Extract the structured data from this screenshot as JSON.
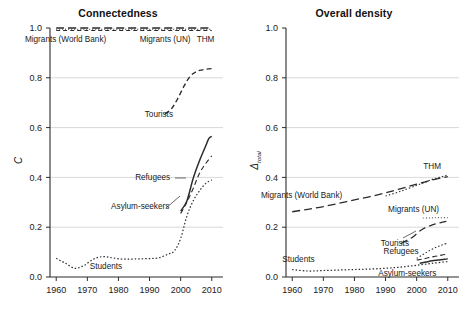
{
  "figure": {
    "width": 472,
    "height": 312,
    "background": "#ffffff",
    "ink": "#2b2b2b",
    "grid_color": "#c9c9c9"
  },
  "chart_data": [
    {
      "type": "line",
      "panel": "left",
      "title": "Connectedness",
      "xlabel": "",
      "ylabel": "C",
      "xlim": [
        1958,
        2012
      ],
      "ylim": [
        0.0,
        1.0
      ],
      "grid": true,
      "grid_axis": "y",
      "legend_position": "inline-annotations",
      "xticks": [
        1960,
        1970,
        1980,
        1990,
        2000,
        2010
      ],
      "xtick_labels": [
        "1960",
        "1970",
        "1980",
        "1990",
        "2000",
        "2010"
      ],
      "yticks": [
        0.0,
        0.2,
        0.4,
        0.6,
        0.8,
        1.0
      ],
      "ytick_labels": [
        "0.0",
        "0.2",
        "0.4",
        "0.6",
        "0.8",
        "1.0"
      ],
      "series": [
        {
          "name": "Migrants (World Bank)",
          "dash": "8,4",
          "width": 1.3,
          "x": [
            1960,
            1970,
            1980,
            1990,
            2000,
            2010
          ],
          "values": [
            1.0,
            1.0,
            1.0,
            1.0,
            1.0,
            1.0
          ]
        },
        {
          "name": "Migrants (UN)",
          "dash": "1,2",
          "width": 1.1,
          "x": [
            1960,
            1970,
            1980,
            1990,
            2000,
            2010
          ],
          "values": [
            0.995,
            0.995,
            0.995,
            0.995,
            0.995,
            0.995
          ]
        },
        {
          "name": "THM",
          "dash": "4,3",
          "width": 1.2,
          "x": [
            1960,
            1970,
            1980,
            1990,
            2000,
            2010
          ],
          "values": [
            0.99,
            0.99,
            0.99,
            0.99,
            0.99,
            0.99
          ]
        },
        {
          "name": "Tourists",
          "dash": "5,3",
          "width": 1.4,
          "x": [
            1995,
            1997,
            1999,
            2001,
            2003,
            2005,
            2007,
            2009,
            2010
          ],
          "values": [
            0.655,
            0.675,
            0.715,
            0.765,
            0.805,
            0.825,
            0.832,
            0.836,
            0.837
          ]
        },
        {
          "name": "Refugees",
          "dash": "5,3",
          "width": 1.1,
          "x": [
            2000,
            2002,
            2004,
            2006,
            2008,
            2010
          ],
          "values": [
            0.255,
            0.3,
            0.355,
            0.415,
            0.455,
            0.487
          ]
        },
        {
          "name": "Asylum-seekers",
          "dash": "none",
          "width": 1.5,
          "x": [
            2000,
            2002,
            2004,
            2006,
            2008,
            2009,
            2010
          ],
          "values": [
            0.265,
            0.305,
            0.395,
            0.465,
            0.525,
            0.555,
            0.565
          ]
        },
        {
          "name": "Students",
          "dash": "1.5,2",
          "width": 1.2,
          "x": [
            1960,
            1963,
            1966,
            1969,
            1972,
            1975,
            1978,
            1981,
            1984,
            1987,
            1990,
            1993,
            1996,
            1998,
            2000,
            2002,
            2004,
            2006,
            2008,
            2010
          ],
          "values": [
            0.075,
            0.055,
            0.035,
            0.047,
            0.072,
            0.082,
            0.077,
            0.072,
            0.072,
            0.073,
            0.074,
            0.077,
            0.092,
            0.105,
            0.155,
            0.245,
            0.305,
            0.345,
            0.375,
            0.39
          ]
        }
      ],
      "annotations": [
        {
          "text": "Migrants (World Bank)",
          "x": 1963,
          "y": 0.955
        },
        {
          "text": "Migrants (UN)",
          "x": 1995,
          "y": 0.955
        },
        {
          "text": "THM",
          "x": 2008,
          "y": 0.955
        },
        {
          "text": "Tourists",
          "x": 1993,
          "y": 0.655
        },
        {
          "text": "Refugees",
          "x": 1991,
          "y": 0.4
        },
        {
          "text": "Asylum-seekers",
          "x": 1987,
          "y": 0.285
        },
        {
          "text": "Students",
          "x": 1976,
          "y": 0.045
        }
      ]
    },
    {
      "type": "line",
      "panel": "right",
      "title": "Overall density",
      "xlabel": "",
      "ylabel": "Δ",
      "ylabel_sub": "total",
      "xlim": [
        1958,
        2012
      ],
      "ylim": [
        0.0,
        1.0
      ],
      "grid": true,
      "grid_axis": "y",
      "legend_position": "inline-annotations",
      "xticks": [
        1960,
        1970,
        1980,
        1990,
        2000,
        2010
      ],
      "xtick_labels": [
        "1960",
        "1970",
        "1980",
        "1990",
        "2000",
        "2010"
      ],
      "yticks": [
        0.0,
        0.2,
        0.4,
        0.6,
        0.8,
        1.0
      ],
      "ytick_labels": [
        "0.0",
        "0.2",
        "0.4",
        "0.6",
        "0.8",
        "1.0"
      ],
      "series": [
        {
          "name": "Migrants (World Bank)",
          "dash": "8,4",
          "width": 1.3,
          "x": [
            1960,
            1965,
            1970,
            1975,
            1980,
            1985,
            1990,
            1995,
            2000,
            2005,
            2010
          ],
          "values": [
            0.262,
            0.272,
            0.283,
            0.296,
            0.31,
            0.323,
            0.338,
            0.355,
            0.373,
            0.39,
            0.403
          ]
        },
        {
          "name": "THM",
          "dash": "1.5,2",
          "width": 1.1,
          "x": [
            1990,
            1995,
            2000,
            2003,
            2005,
            2007,
            2009,
            2010
          ],
          "values": [
            0.325,
            0.345,
            0.368,
            0.382,
            0.392,
            0.399,
            0.406,
            0.41
          ]
        },
        {
          "name": "Migrants (UN)",
          "dash": "1,2",
          "width": 1.0,
          "x": [
            2002,
            2004,
            2006,
            2008,
            2010
          ],
          "values": [
            0.237,
            0.237,
            0.238,
            0.238,
            0.238
          ]
        },
        {
          "name": "Tourists",
          "dash": "7,4",
          "width": 1.3,
          "x": [
            1995,
            1997,
            1999,
            2001,
            2003,
            2005,
            2007,
            2009,
            2010
          ],
          "values": [
            0.135,
            0.148,
            0.163,
            0.185,
            0.2,
            0.209,
            0.216,
            0.222,
            0.225
          ]
        },
        {
          "name": "Refugees",
          "dash": "1.5,2",
          "width": 1.1,
          "x": [
            2000,
            2002,
            2004,
            2006,
            2008,
            2010
          ],
          "values": [
            0.075,
            0.09,
            0.105,
            0.118,
            0.128,
            0.136
          ]
        },
        {
          "name": "Asylum-seekers",
          "dash": "none",
          "width": 1.5,
          "x": [
            2001,
            2003,
            2005,
            2007,
            2009,
            2010
          ],
          "values": [
            0.055,
            0.06,
            0.065,
            0.068,
            0.071,
            0.073
          ]
        },
        {
          "name": "Asylum-seekers-dashed",
          "dash": "5,3",
          "width": 1.1,
          "x": [
            2000,
            2002,
            2004,
            2006,
            2008,
            2010
          ],
          "values": [
            0.068,
            0.072,
            0.078,
            0.083,
            0.088,
            0.092
          ]
        },
        {
          "name": "Students",
          "dash": "1.5,2",
          "width": 1.2,
          "x": [
            1960,
            1965,
            1970,
            1975,
            1980,
            1985,
            1990,
            1995,
            2000,
            2005,
            2010
          ],
          "values": [
            0.03,
            0.024,
            0.026,
            0.028,
            0.03,
            0.032,
            0.035,
            0.04,
            0.047,
            0.055,
            0.062
          ]
        }
      ],
      "annotations": [
        {
          "text": "THM",
          "x": 2005,
          "y": 0.445
        },
        {
          "text": "Migrants (World Bank)",
          "x": 1963,
          "y": 0.328
        },
        {
          "text": "Migrants (UN)",
          "x": 1999,
          "y": 0.272
        },
        {
          "text": "Tourists",
          "x": 1993,
          "y": 0.137
        },
        {
          "text": "Refugees",
          "x": 1995,
          "y": 0.105
        },
        {
          "text": "Students",
          "x": 1962,
          "y": 0.072
        },
        {
          "text": "Asylum-seekers",
          "x": 1997,
          "y": 0.018
        }
      ]
    }
  ]
}
